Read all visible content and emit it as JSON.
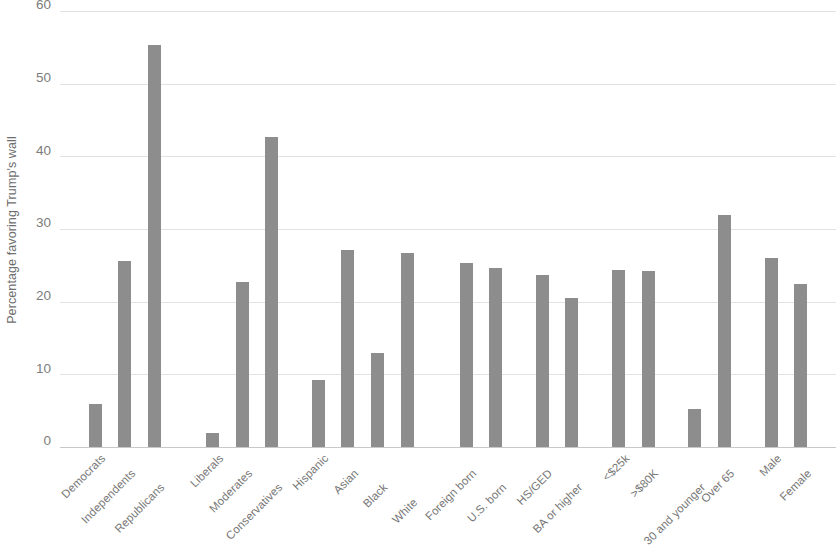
{
  "chart_data": {
    "type": "bar",
    "title": "",
    "subtitle": "",
    "xlabel": "",
    "ylabel": "Percentage favoring Trump's wall",
    "ylim": [
      0,
      60
    ],
    "yticks": [
      0,
      10,
      20,
      30,
      40,
      50,
      60
    ],
    "ytick_labels": [
      "0",
      "10",
      "20",
      "30",
      "40",
      "50",
      "60"
    ],
    "grid": true,
    "legend": false,
    "legend_position": "none",
    "bar_color": "#8d8d8d",
    "gridline_color": "#e2e2e2",
    "axis_color": "#c8c8c8",
    "text_color": "#767676",
    "categories": [
      "Democrats",
      "Independents",
      "Republicans",
      "Liberals",
      "Moderates",
      "Conservatives",
      "Hispanic",
      "Asian",
      "Black",
      "White",
      "Foreign born",
      "U.S. born",
      "HS/GED",
      "BA or higher",
      "<$25k",
      ">$80K",
      "30 and younger",
      "Over 65",
      "Male",
      "Female"
    ],
    "values": [
      6.1,
      25.8,
      55.4,
      2.0,
      22.8,
      42.8,
      9.3,
      27.3,
      13.1,
      26.9,
      25.4,
      24.8,
      23.8,
      20.6,
      24.5,
      24.3,
      5.4,
      32.0,
      26.2,
      22.6
    ],
    "groups": [
      {
        "name": "Party",
        "categories": [
          "Democrats",
          "Independents",
          "Republicans"
        ]
      },
      {
        "name": "Ideology",
        "categories": [
          "Liberals",
          "Moderates",
          "Conservatives"
        ]
      },
      {
        "name": "Race/Ethnicity",
        "categories": [
          "Hispanic",
          "Asian",
          "Black",
          "White"
        ]
      },
      {
        "name": "Nativity",
        "categories": [
          "Foreign born",
          "U.S. born"
        ]
      },
      {
        "name": "Education",
        "categories": [
          "HS/GED",
          "BA or higher"
        ]
      },
      {
        "name": "Income",
        "categories": [
          "<$25k",
          ">$80K"
        ]
      },
      {
        "name": "Age",
        "categories": [
          "30 and younger",
          "Over 65"
        ]
      },
      {
        "name": "Gender",
        "categories": [
          "Male",
          "Female"
        ]
      }
    ],
    "bar_x_centers": [
      74,
      136,
      198,
      320,
      382,
      444,
      542,
      604,
      666,
      728,
      852,
      914,
      1012,
      1074,
      1172,
      1234,
      1332,
      1394,
      1492,
      1554
    ],
    "label_rows": [
      0,
      1,
      2,
      0,
      1,
      2,
      0,
      1,
      2,
      3,
      1,
      2,
      1,
      2,
      0,
      1,
      2,
      1,
      0,
      1
    ]
  }
}
